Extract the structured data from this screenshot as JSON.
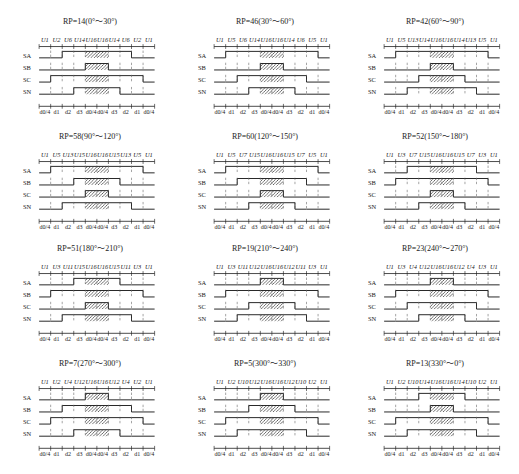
{
  "diagram": {
    "rows": [
      "SA",
      "SB",
      "SC",
      "SN"
    ],
    "bottom_labels": [
      "d0/4",
      "d1",
      "d2",
      "d3",
      "d0/4",
      "d0/4",
      "d3",
      "d2",
      "d1",
      "d0/4"
    ],
    "panels": [
      {
        "title": "RP=14(0°～30°)",
        "vectors": [
          "U1",
          "U2",
          "U6",
          "U14",
          "U16"
        ],
        "states": {
          "SA": [
            0,
            0,
            1,
            1,
            1
          ],
          "SB": [
            0,
            0,
            0,
            0,
            1
          ],
          "SC": [
            0,
            1,
            1,
            1,
            1
          ],
          "SN": [
            0,
            0,
            0,
            1,
            1
          ]
        }
      },
      {
        "title": "RP=46(30°～60°)",
        "vectors": [
          "U1",
          "U5",
          "U6",
          "U14",
          "U16"
        ],
        "states": {
          "SA": [
            0,
            1,
            1,
            1,
            1
          ],
          "SB": [
            0,
            0,
            0,
            0,
            1
          ],
          "SC": [
            0,
            0,
            1,
            1,
            1
          ],
          "SN": [
            0,
            0,
            0,
            1,
            1
          ]
        }
      },
      {
        "title": "RP=42(60°～90°)",
        "vectors": [
          "U1",
          "U5",
          "U13",
          "U14",
          "U16"
        ],
        "states": {
          "SA": [
            0,
            1,
            1,
            1,
            1
          ],
          "SB": [
            0,
            0,
            0,
            0,
            1
          ],
          "SC": [
            0,
            0,
            0,
            1,
            1
          ],
          "SN": [
            0,
            0,
            1,
            1,
            1
          ]
        }
      },
      {
        "title": "RP=58(90°～120°)",
        "vectors": [
          "U1",
          "U5",
          "U13",
          "U15",
          "U16"
        ],
        "states": {
          "SA": [
            0,
            1,
            1,
            1,
            1
          ],
          "SB": [
            0,
            0,
            0,
            1,
            1
          ],
          "SC": [
            0,
            0,
            0,
            0,
            1
          ],
          "SN": [
            0,
            0,
            1,
            1,
            1
          ]
        }
      },
      {
        "title": "RP=60(120°～150°)",
        "vectors": [
          "U1",
          "U5",
          "U7",
          "U15",
          "U16"
        ],
        "states": {
          "SA": [
            0,
            1,
            1,
            1,
            1
          ],
          "SB": [
            0,
            0,
            1,
            1,
            1
          ],
          "SC": [
            0,
            0,
            0,
            0,
            1
          ],
          "SN": [
            0,
            0,
            0,
            1,
            1
          ]
        }
      },
      {
        "title": "RP=52(150°～180°)",
        "vectors": [
          "U1",
          "U3",
          "U7",
          "U15",
          "U16"
        ],
        "states": {
          "SA": [
            0,
            0,
            1,
            1,
            1
          ],
          "SB": [
            0,
            1,
            1,
            1,
            1
          ],
          "SC": [
            0,
            0,
            0,
            0,
            1
          ],
          "SN": [
            0,
            0,
            0,
            1,
            1
          ]
        }
      },
      {
        "title": "RP=51(180°～210°)",
        "vectors": [
          "U1",
          "U3",
          "U11",
          "U15",
          "U16"
        ],
        "states": {
          "SA": [
            0,
            0,
            0,
            1,
            1
          ],
          "SB": [
            0,
            1,
            1,
            1,
            1
          ],
          "SC": [
            0,
            0,
            0,
            0,
            1
          ],
          "SN": [
            0,
            0,
            1,
            1,
            1
          ]
        }
      },
      {
        "title": "RP=19(210°～240°)",
        "vectors": [
          "U1",
          "U3",
          "U11",
          "U12",
          "U16"
        ],
        "states": {
          "SA": [
            0,
            0,
            0,
            0,
            1
          ],
          "SB": [
            0,
            1,
            1,
            1,
            1
          ],
          "SC": [
            0,
            0,
            0,
            1,
            1
          ],
          "SN": [
            0,
            0,
            1,
            1,
            1
          ]
        }
      },
      {
        "title": "RP=23(240°～270°)",
        "vectors": [
          "U1",
          "U3",
          "U4",
          "U12",
          "U16"
        ],
        "states": {
          "SA": [
            0,
            0,
            0,
            0,
            1
          ],
          "SB": [
            0,
            1,
            1,
            1,
            1
          ],
          "SC": [
            0,
            0,
            1,
            1,
            1
          ],
          "SN": [
            0,
            0,
            0,
            1,
            1
          ]
        }
      },
      {
        "title": "RP=7(270°～300°)",
        "vectors": [
          "U1",
          "U2",
          "U4",
          "U12",
          "U16"
        ],
        "states": {
          "SA": [
            0,
            0,
            0,
            0,
            1
          ],
          "SB": [
            0,
            0,
            1,
            1,
            1
          ],
          "SC": [
            0,
            1,
            1,
            1,
            1
          ],
          "SN": [
            0,
            0,
            0,
            1,
            1
          ]
        }
      },
      {
        "title": "RP=5(300°～330°)",
        "vectors": [
          "U1",
          "U2",
          "U10",
          "U12",
          "U16"
        ],
        "states": {
          "SA": [
            0,
            0,
            0,
            0,
            1
          ],
          "SB": [
            0,
            0,
            0,
            1,
            1
          ],
          "SC": [
            0,
            1,
            1,
            1,
            1
          ],
          "SN": [
            0,
            0,
            1,
            1,
            1
          ]
        }
      },
      {
        "title": "RP=13(330°～0°)",
        "vectors": [
          "U1",
          "U2",
          "U10",
          "U14",
          "U16"
        ],
        "states": {
          "SA": [
            0,
            0,
            0,
            1,
            1
          ],
          "SB": [
            0,
            0,
            0,
            0,
            1
          ],
          "SC": [
            0,
            1,
            1,
            1,
            1
          ],
          "SN": [
            0,
            0,
            1,
            1,
            1
          ]
        }
      }
    ]
  }
}
